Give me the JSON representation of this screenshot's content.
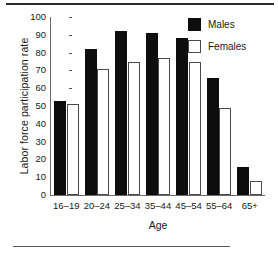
{
  "chart_data": {
    "type": "bar",
    "title": "",
    "xlabel": "Age",
    "ylabel": "Labor force participation rate",
    "categories": [
      "16–19",
      "20–24",
      "25–34",
      "35–44",
      "45–54",
      "55–64",
      "65+"
    ],
    "series": [
      {
        "name": "Males",
        "color": "#0d0d0d",
        "values": [
          53,
          82,
          92,
          91,
          88,
          66,
          16
        ]
      },
      {
        "name": "Females",
        "color": "#ffffff",
        "values": [
          51,
          71,
          75,
          77,
          75,
          49,
          8
        ]
      }
    ],
    "ylim": [
      0,
      100
    ],
    "ytick_values": [
      0,
      10,
      20,
      30,
      40,
      50,
      60,
      70,
      80,
      90,
      100
    ],
    "ytick_labels": [
      "0",
      "10",
      "20",
      "30",
      "40",
      "50",
      "60",
      "70",
      "80",
      "90",
      "100"
    ],
    "grid": false,
    "legend_position": "top-right",
    "legend_entries": [
      "Males",
      "Females"
    ]
  },
  "legend": {
    "males_label": "Males",
    "females_label": "Females"
  },
  "axes": {
    "y_title": "Labor force participation rate",
    "x_title": "Age"
  }
}
